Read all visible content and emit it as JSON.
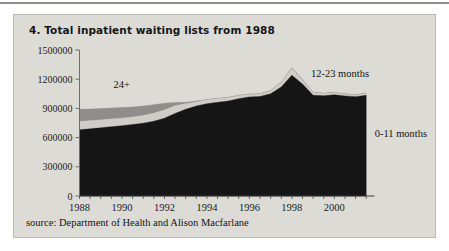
{
  "figure": {
    "title": "4. Total inpatient waiting lists from 1988",
    "source": "source: Department of Health and Alison Macfarlane",
    "panel_bg": "#dcdbd6"
  },
  "chart_data": {
    "type": "area",
    "stacked": true,
    "title": "4. Total inpatient waiting lists from 1988",
    "xlabel": "",
    "ylabel": "",
    "grid": false,
    "legend_position": "annotations-on-plot",
    "xlim": [
      1988,
      2001.75
    ],
    "ylim": [
      0,
      1500000
    ],
    "yticks": [
      0,
      300000,
      600000,
      900000,
      1200000,
      1500000
    ],
    "ytick_labels": [
      "0",
      "300000",
      "600000",
      "900000",
      "1200000",
      "1500000"
    ],
    "xticks": [
      1988,
      1990,
      1992,
      1994,
      1996,
      1998,
      2000
    ],
    "xtick_labels": [
      "1988",
      "1990",
      "1992",
      "1994",
      "1996",
      "1998",
      "2000"
    ],
    "x": [
      1988,
      1988.5,
      1989,
      1989.5,
      1990,
      1990.5,
      1991,
      1991.5,
      1992,
      1992.5,
      1993,
      1993.5,
      1994,
      1994.5,
      1995,
      1995.5,
      1996,
      1996.5,
      1997,
      1997.5,
      1998,
      1998.5,
      1999,
      1999.5,
      2000,
      2000.5,
      2001,
      2001.5
    ],
    "series": [
      {
        "name": "0-11 months",
        "color": "#151515",
        "values": [
          680000,
          690000,
          700000,
          712000,
          722000,
          735000,
          748000,
          768000,
          800000,
          848000,
          890000,
          925000,
          948000,
          962000,
          975000,
          1000000,
          1018000,
          1022000,
          1050000,
          1120000,
          1240000,
          1150000,
          1035000,
          1030000,
          1040000,
          1028000,
          1020000,
          1035000
        ]
      },
      {
        "name": "12-23 months",
        "color": "#cfcdc8",
        "values": [
          85000,
          84000,
          82000,
          80000,
          78000,
          76000,
          80000,
          82000,
          84000,
          78000,
          58000,
          42000,
          38000,
          36000,
          34000,
          30000,
          26000,
          24000,
          30000,
          46000,
          70000,
          40000,
          26000,
          22000,
          20000,
          18000,
          16000,
          18000
        ]
      },
      {
        "name": "24+",
        "color": "#8f8e8a",
        "values": [
          125000,
          120000,
          116000,
          112000,
          110000,
          104000,
          96000,
          88000,
          70000,
          34000,
          14000,
          8000,
          6000,
          6000,
          6000,
          5000,
          5000,
          5000,
          5000,
          6000,
          8000,
          6000,
          5000,
          5000,
          5000,
          5000,
          5000,
          5000
        ]
      }
    ],
    "annotations": [
      {
        "text": "24+",
        "x": 1989.6,
        "y": 1110000
      },
      {
        "text": "12-23 months",
        "x": 1998.9,
        "y": 1225000
      },
      {
        "text": "0-11 months",
        "x": 2001.9,
        "y": 610000
      }
    ],
    "peak": {
      "year": 1998,
      "total": 1318000
    },
    "start": {
      "year": 1988,
      "total": 890000
    },
    "end": {
      "year": 2001.5,
      "total": 1058000
    }
  }
}
